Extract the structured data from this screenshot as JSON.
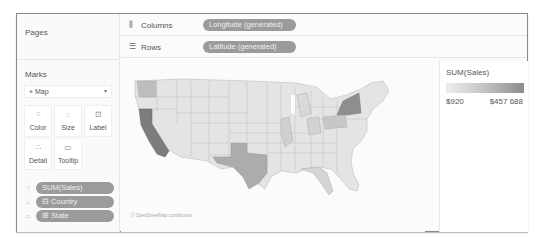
{
  "pages": {
    "title": "Pages"
  },
  "shelves": {
    "columns": {
      "icon": "columns-icon",
      "label": "Columns",
      "pill": "Longitude (generated)"
    },
    "rows": {
      "icon": "rows-icon",
      "label": "Rows",
      "pill": "Latitude (generated)"
    }
  },
  "marks": {
    "title": "Marks",
    "mark_type": "Map",
    "buttons": [
      {
        "name": "color",
        "label": "Color",
        "icon": "⁘"
      },
      {
        "name": "size",
        "label": "Size",
        "icon": "◌"
      },
      {
        "name": "label",
        "label": "Label",
        "icon": "⊡"
      },
      {
        "name": "detail",
        "label": "Detail",
        "icon": "∴"
      },
      {
        "name": "tooltip",
        "label": "Tooltip",
        "icon": "▭"
      }
    ],
    "fields": [
      {
        "icon": "⁘",
        "label": "SUM(Sales)"
      },
      {
        "icon": "∴",
        "label": "⊟ Country"
      },
      {
        "icon": "∴",
        "label": "⊞ State"
      }
    ]
  },
  "view": {
    "attribution": "© OpenStreetMap contributors"
  },
  "legend": {
    "title": "SUM(Sales)",
    "min": "$920",
    "max": "$457 688",
    "color_low": "#ededed",
    "color_high": "#8c8c8c"
  }
}
